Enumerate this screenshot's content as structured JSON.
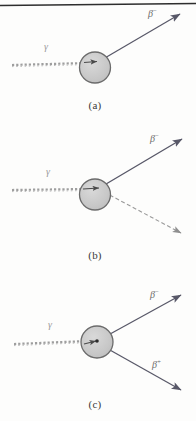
{
  "figure": {
    "background_color": "#fdfdfc",
    "top_rule_color": "#2e2e2e",
    "nucleus_fill": "#c9c9c9",
    "nucleus_stroke": "#6b6b6b",
    "solid_line_color": "#585868",
    "dashed_line_color": "#9a9a9a",
    "photon_line_color": "#9a9a9a"
  },
  "panels": [
    {
      "id": "a",
      "caption": "(a)",
      "incoming": {
        "label": "γ",
        "style": "wavy-dashed",
        "name": "gamma"
      },
      "outgoing": [
        {
          "label": "β",
          "charge": "−",
          "style": "solid",
          "direction": "up-right"
        }
      ]
    },
    {
      "id": "b",
      "caption": "(b)",
      "incoming": {
        "label": "γ",
        "style": "wavy-dashed",
        "name": "gamma"
      },
      "outgoing": [
        {
          "label": "β",
          "charge": "−",
          "style": "solid",
          "direction": "up-right"
        },
        {
          "label": "",
          "charge": "",
          "style": "dashed",
          "direction": "down-right"
        }
      ]
    },
    {
      "id": "c",
      "caption": "(c)",
      "incoming": {
        "label": "γ",
        "style": "wavy-dashed",
        "name": "gamma"
      },
      "outgoing": [
        {
          "label": "β",
          "charge": "−",
          "style": "solid",
          "direction": "up-right"
        },
        {
          "label": "β",
          "charge": "+",
          "style": "solid",
          "direction": "down-right"
        }
      ]
    }
  ],
  "labels": {
    "gamma_a": "γ",
    "gamma_b": "γ",
    "gamma_c": "γ",
    "beta_minus_a": "β",
    "beta_minus_a_sup": "−",
    "beta_minus_b": "β",
    "beta_minus_b_sup": "−",
    "beta_minus_c": "β",
    "beta_minus_c_sup": "−",
    "beta_plus_c": "β",
    "beta_plus_c_sup": "+",
    "caption_a": "(a)",
    "caption_b": "(b)",
    "caption_c": "(c)"
  }
}
